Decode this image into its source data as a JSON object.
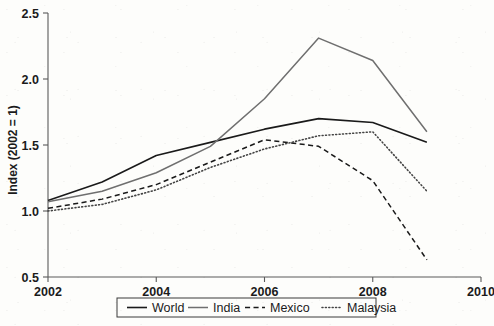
{
  "chart_data": {
    "type": "line",
    "title": "",
    "subtitle": "",
    "xlabel": "",
    "ylabel": "Index (2002 = 1)",
    "xlim": [
      2002,
      2010
    ],
    "ylim": [
      0.5,
      2.5
    ],
    "xticks": [
      "2002",
      "2004",
      "2006",
      "2008",
      "2010"
    ],
    "xtick_values": [
      2002,
      2004,
      2006,
      2008,
      2010
    ],
    "yticks": [
      "0.5",
      "1.0",
      "1.5",
      "2.0",
      "2.5"
    ],
    "ytick_values": [
      0.5,
      1.0,
      1.5,
      2.0,
      2.5
    ],
    "grid": false,
    "legend_position": "bottom-center",
    "x": [
      2002,
      2003,
      2004,
      2005,
      2006,
      2007,
      2008,
      2009
    ],
    "series": [
      {
        "name": "World",
        "style": "solid",
        "color": "#1a1a1a",
        "width": 1.6,
        "values": [
          1.08,
          1.22,
          1.42,
          1.52,
          1.62,
          1.7,
          1.67,
          1.52
        ]
      },
      {
        "name": "India",
        "style": "solid",
        "color": "#6f6f6f",
        "width": 1.5,
        "values": [
          1.07,
          1.15,
          1.29,
          1.49,
          1.85,
          2.31,
          2.14,
          1.6
        ]
      },
      {
        "name": "Mexico",
        "style": "dashed",
        "color": "#1a1a1a",
        "width": 1.5,
        "values": [
          1.02,
          1.09,
          1.2,
          1.37,
          1.54,
          1.49,
          1.23,
          0.63
        ]
      },
      {
        "name": "Malaysia",
        "style": "dotted",
        "color": "#444444",
        "width": 1.6,
        "values": [
          1.0,
          1.05,
          1.16,
          1.33,
          1.47,
          1.57,
          1.6,
          1.15
        ]
      }
    ]
  },
  "legend": {
    "entries": [
      {
        "label": "World"
      },
      {
        "label": "India"
      },
      {
        "label": "Mexico"
      },
      {
        "label": "Malaysia"
      }
    ]
  },
  "axes": {
    "y_title": "Index (2002 = 1)"
  },
  "colors": {
    "background": "#fdfdfb",
    "axis": "#5a5a5a",
    "text": "#1b1b1b",
    "world": "#1a1a1a",
    "india": "#6f6f6f",
    "mexico": "#1a1a1a",
    "malaysia": "#444444"
  }
}
